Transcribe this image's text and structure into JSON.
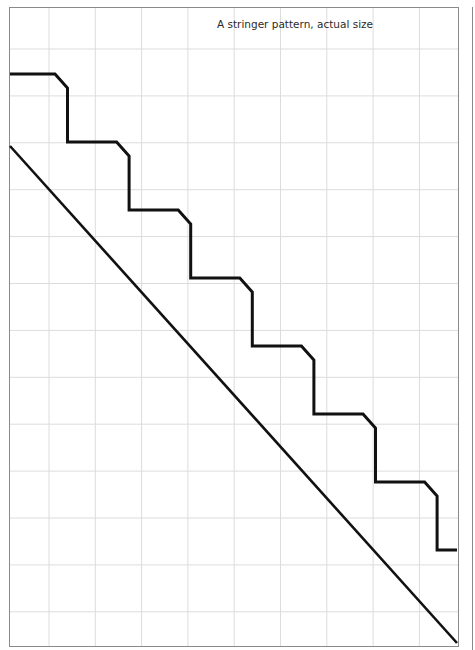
{
  "diagram": {
    "title": "A stringer pattern, actual size",
    "grid": {
      "columns": 10,
      "rows": 14,
      "line_color": "#dcdcdc"
    },
    "frame_color": "#8a8a8a",
    "stroke_color": "#111111",
    "stringer": {
      "steps": 6,
      "rise_units": 1.45,
      "run_units": 1.33
    }
  }
}
